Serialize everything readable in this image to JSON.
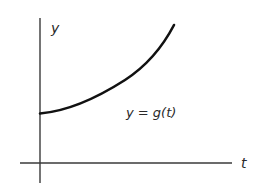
{
  "figure": {
    "axes": {
      "x_label": "t",
      "y_label": "y"
    },
    "curve_label": "y = g(t)",
    "colors": {
      "axis": "#3a3a3a",
      "curve": "#111111",
      "text": "#2a2a2a",
      "background": "#ffffff"
    }
  }
}
